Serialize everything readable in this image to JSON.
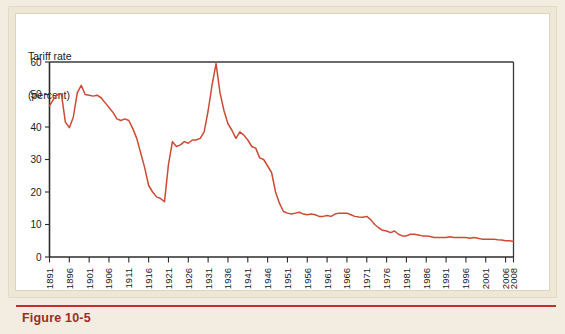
{
  "figure": {
    "caption": "Figure 10-5",
    "caption_color": "#9b2d22",
    "background_color": "#efe7d6",
    "panel_color": "#ffffff"
  },
  "chart_data": {
    "type": "line",
    "title": "",
    "subtitle": "",
    "ylabel_line1": "Tariff rate",
    "ylabel_line2": "(percent)",
    "xlabel": "",
    "ylim": [
      0,
      60
    ],
    "xlim": [
      1891,
      2008
    ],
    "y_ticks": [
      0,
      10,
      20,
      30,
      40,
      50,
      60
    ],
    "y_tick_labels": [
      "0",
      "10",
      "20",
      "30",
      "40",
      "50",
      "60"
    ],
    "x_ticks": [
      1891,
      1896,
      1901,
      1906,
      1911,
      1916,
      1921,
      1926,
      1931,
      1936,
      1941,
      1946,
      1951,
      1956,
      1961,
      1966,
      1971,
      1976,
      1981,
      1986,
      1991,
      1996,
      2001,
      2006,
      2008
    ],
    "x_tick_labels": [
      "1891",
      "1896",
      "1901",
      "1906",
      "1911",
      "1916",
      "1921",
      "1926",
      "1931",
      "1936",
      "1941",
      "1946",
      "1951",
      "1956",
      "1961",
      "1966",
      "1971",
      "1976",
      "1981",
      "1986",
      "1991",
      "1996",
      "2001",
      "2006",
      "2008"
    ],
    "grid": false,
    "legend": null,
    "series": [
      {
        "name": "Average tariff rate",
        "color": "#cc4b33",
        "x": [
          1891,
          1892,
          1893,
          1894,
          1895,
          1896,
          1897,
          1898,
          1899,
          1900,
          1901,
          1902,
          1903,
          1904,
          1905,
          1906,
          1907,
          1908,
          1909,
          1910,
          1911,
          1912,
          1913,
          1914,
          1915,
          1916,
          1917,
          1918,
          1919,
          1920,
          1921,
          1922,
          1923,
          1924,
          1925,
          1926,
          1927,
          1928,
          1929,
          1930,
          1931,
          1932,
          1933,
          1934,
          1935,
          1936,
          1937,
          1938,
          1939,
          1940,
          1941,
          1942,
          1943,
          1944,
          1945,
          1946,
          1947,
          1948,
          1949,
          1950,
          1951,
          1952,
          1953,
          1954,
          1955,
          1956,
          1957,
          1958,
          1959,
          1960,
          1961,
          1962,
          1963,
          1964,
          1965,
          1966,
          1967,
          1968,
          1969,
          1970,
          1971,
          1972,
          1973,
          1974,
          1975,
          1976,
          1977,
          1978,
          1979,
          1980,
          1981,
          1982,
          1983,
          1984,
          1985,
          1986,
          1987,
          1988,
          1989,
          1990,
          1991,
          1992,
          1993,
          1994,
          1995,
          1996,
          1997,
          1998,
          1999,
          2000,
          2001,
          2002,
          2003,
          2004,
          2005,
          2006,
          2007,
          2008
        ],
        "values": [
          46.5,
          48.5,
          50.0,
          50.2,
          41.5,
          39.8,
          43.0,
          50.5,
          52.8,
          50.0,
          49.8,
          49.5,
          49.8,
          49.0,
          47.5,
          46.0,
          44.5,
          42.5,
          42.0,
          42.5,
          42.0,
          39.5,
          36.5,
          32.0,
          27.5,
          22.0,
          20.0,
          18.5,
          18.0,
          17.0,
          28.5,
          35.5,
          34.0,
          34.5,
          35.5,
          35.0,
          36.0,
          36.0,
          36.5,
          38.5,
          45.0,
          53.0,
          59.5,
          50.5,
          45.0,
          41.0,
          39.0,
          36.5,
          38.5,
          37.5,
          36.0,
          34.0,
          33.5,
          30.5,
          30.0,
          28.0,
          26.0,
          20.0,
          16.5,
          14.0,
          13.5,
          13.2,
          13.5,
          13.8,
          13.2,
          13.0,
          13.2,
          13.0,
          12.5,
          12.5,
          12.8,
          12.5,
          13.2,
          13.5,
          13.5,
          13.5,
          13.0,
          12.5,
          12.3,
          12.2,
          12.5,
          11.5,
          10.0,
          9.0,
          8.2,
          8.0,
          7.5,
          8.0,
          7.0,
          6.5,
          6.5,
          7.0,
          7.0,
          6.8,
          6.5,
          6.5,
          6.3,
          6.0,
          6.0,
          6.0,
          6.0,
          6.2,
          6.0,
          6.0,
          6.0,
          6.0,
          5.8,
          6.0,
          5.8,
          5.5,
          5.5,
          5.5,
          5.5,
          5.3,
          5.2,
          5.0,
          5.0,
          4.8
        ]
      }
    ]
  }
}
